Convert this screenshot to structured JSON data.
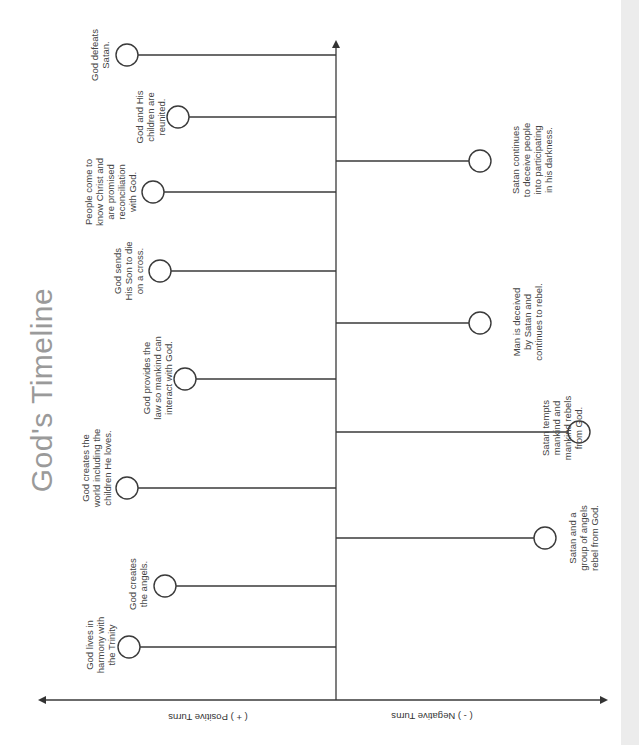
{
  "title": "God's Timeline",
  "axis": {
    "positive_label": "( + ) Positive Turns",
    "negative_label": "( - ) Negative Turns"
  },
  "colors": {
    "line": "#3a3a3a",
    "title": "#9a9a9a",
    "text": "#444444",
    "strip": "#ececec"
  },
  "events": [
    {
      "id": "trinity",
      "side": "positive",
      "order": 1,
      "text": "God lives in\nharmony with\nthe Trinity",
      "cx": 129,
      "cy": 647,
      "lx": 100,
      "ly": 645
    },
    {
      "id": "angels-created",
      "side": "positive",
      "order": 2,
      "text": "God creates\nthe angels.",
      "cx": 165,
      "cy": 586,
      "lx": 138,
      "ly": 584
    },
    {
      "id": "angels-rebel",
      "side": "negative",
      "order": 3,
      "text": "Satan and a\ngroup of angels\nrebel from God.",
      "cx": 545,
      "cy": 538,
      "lx": 583,
      "ly": 538
    },
    {
      "id": "world-created",
      "side": "positive",
      "order": 4,
      "text": "God creates the\nworld including the\nchildren He loves.",
      "cx": 127,
      "cy": 488,
      "lx": 96,
      "ly": 468
    },
    {
      "id": "mankind-rebels",
      "side": "negative",
      "order": 5,
      "text": "Satan tempts\nmankind and\nmankind rebels\nfrom God.",
      "cx": 579,
      "cy": 432,
      "lx": 562,
      "ly": 428
    },
    {
      "id": "law",
      "side": "positive",
      "order": 6,
      "text": "God provides the\nlaw so mankind can\ninteract with God.",
      "cx": 185,
      "cy": 379,
      "lx": 157,
      "ly": 378
    },
    {
      "id": "man-deceived",
      "side": "negative",
      "order": 7,
      "text": "Man is deceived\nby Satan and\ncontinues to rebel.",
      "cx": 480,
      "cy": 323,
      "lx": 527,
      "ly": 322
    },
    {
      "id": "cross",
      "side": "positive",
      "order": 8,
      "text": "God sends\nHis Son to die\non a cross.",
      "cx": 160,
      "cy": 271,
      "lx": 128,
      "ly": 271
    },
    {
      "id": "reconciliation",
      "side": "positive",
      "order": 9,
      "text": "People come to\nknow Christ and\nare promised\nreconciliation\nwith God.",
      "cx": 153,
      "cy": 192,
      "lx": 110,
      "ly": 192
    },
    {
      "id": "satan-deceives",
      "side": "negative",
      "order": 10,
      "text": "Satan continues\nto deceive people\ninto participating\nin his darkness.",
      "cx": 480,
      "cy": 161,
      "lx": 532,
      "ly": 160
    },
    {
      "id": "reunited",
      "side": "positive",
      "order": 11,
      "text": "God and His\nchildren are\nreunited.",
      "cx": 178,
      "cy": 117,
      "lx": 150,
      "ly": 117
    },
    {
      "id": "satan-defeated",
      "side": "positive",
      "order": 12,
      "text": "God defeats\nSatan.",
      "cx": 127,
      "cy": 55,
      "lx": 100,
      "ly": 55
    }
  ]
}
